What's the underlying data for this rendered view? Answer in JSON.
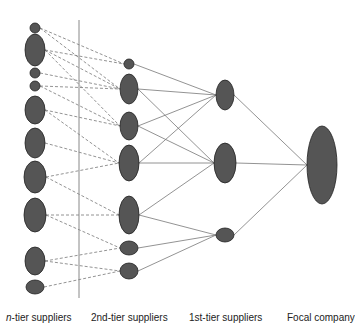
{
  "header": {
    "cut_text": "supply chain of suppliers"
  },
  "colors": {
    "node_fill": "#555555",
    "node_stroke": "#222222",
    "line": "#777777",
    "divider": "#888888"
  },
  "tiers": [
    {
      "id": "n",
      "label_prefix": "n",
      "label_rest": "-tier suppliers",
      "x": 35,
      "nodes": [
        [
          28,
          5,
          5
        ],
        [
          50,
          10,
          16
        ],
        [
          73,
          5,
          5
        ],
        [
          86,
          5,
          5
        ],
        [
          110,
          10,
          14
        ],
        [
          143,
          10,
          15
        ],
        [
          177,
          11,
          16
        ],
        [
          215,
          11,
          17
        ],
        [
          261,
          10,
          14
        ],
        [
          287,
          9,
          7
        ]
      ]
    },
    {
      "id": "2",
      "label": "2nd-tier suppliers",
      "x": 129,
      "nodes": [
        [
          64,
          5,
          5
        ],
        [
          89,
          9,
          15
        ],
        [
          126,
          9,
          14
        ],
        [
          163,
          10,
          18
        ],
        [
          215,
          10,
          19
        ],
        [
          248,
          9,
          7
        ],
        [
          271,
          9,
          8
        ]
      ]
    },
    {
      "id": "1",
      "label": "1st-tier suppliers",
      "x": 225,
      "nodes": [
        [
          95,
          9,
          15
        ],
        [
          163,
          11,
          20
        ],
        [
          235,
          9,
          7
        ]
      ]
    },
    {
      "id": "focal",
      "label": "Focal company",
      "x": 322,
      "nodes": [
        [
          165,
          15,
          39
        ]
      ]
    }
  ],
  "edges_dashed": [
    [
      0,
      0
    ],
    [
      0,
      1
    ],
    [
      1,
      0
    ],
    [
      1,
      1
    ],
    [
      1,
      2
    ],
    [
      2,
      1
    ],
    [
      3,
      1
    ],
    [
      3,
      2
    ],
    [
      4,
      2
    ],
    [
      4,
      3
    ],
    [
      5,
      3
    ],
    [
      6,
      3
    ],
    [
      6,
      4
    ],
    [
      7,
      4
    ],
    [
      7,
      5
    ],
    [
      8,
      5
    ],
    [
      8,
      6
    ],
    [
      9,
      6
    ]
  ],
  "edges_solid_2_to_1": [
    [
      0,
      0
    ],
    [
      1,
      0
    ],
    [
      1,
      1
    ],
    [
      2,
      0
    ],
    [
      2,
      1
    ],
    [
      3,
      0
    ],
    [
      3,
      1
    ],
    [
      4,
      1
    ],
    [
      4,
      2
    ],
    [
      5,
      2
    ],
    [
      6,
      2
    ]
  ],
  "edges_solid_1_to_focal": [
    [
      0,
      0
    ],
    [
      1,
      0
    ],
    [
      2,
      0
    ]
  ],
  "divider": {
    "x": 79,
    "y1": 20,
    "y2": 298
  },
  "labels": {
    "n_tier_prefix": "n",
    "n_tier_rest": "-tier suppliers",
    "second_tier": "2nd-tier suppliers",
    "first_tier": "1st-tier suppliers",
    "focal": "Focal company"
  }
}
